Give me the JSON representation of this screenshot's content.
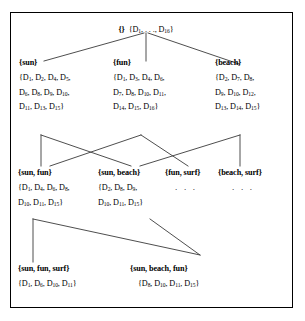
{
  "figure": {
    "type": "concept-lattice-diagram",
    "border_color": "#000000",
    "line_color": "#3a3a3a",
    "background": "#ffffff"
  },
  "nodes": {
    "root": {
      "id": "root",
      "label": "{}",
      "docs": [
        "{D1, . . ., D16}"
      ],
      "docs_plain": "{D1, . . ., D16}"
    },
    "sun": {
      "id": "sun",
      "label": "{sun}",
      "docs": [
        "{D1, D2, D4, D5,",
        "D6, D8, D9, D10,",
        "D11, D13, D15}"
      ]
    },
    "fun": {
      "id": "fun",
      "label": "{fun}",
      "docs": [
        "{D1, D3, D4, D6,",
        "D7, D8, D10, D11,",
        "D14, D15, D16}"
      ]
    },
    "beach": {
      "id": "beach",
      "label": "{beach}",
      "docs": [
        "{D2, D7, D8,",
        "D9, D10, D12,",
        "D13, D14, D15}"
      ]
    },
    "sun_fun": {
      "id": "sun-fun",
      "label": "{sun, fun}",
      "docs": [
        "{D1, D4, D6, D8,",
        "D10, D11, D15}"
      ]
    },
    "sun_beach": {
      "id": "sun-beach",
      "label": "{sun, beach}",
      "docs": [
        "{D2, D8, D9,",
        "D10, D11, D15}"
      ]
    },
    "fun_surf": {
      "id": "fun-surf",
      "label": "{fun, surf}",
      "docs": [
        ". . ."
      ]
    },
    "beach_surf": {
      "id": "beach-surf",
      "label": "{beach, surf}",
      "docs": [
        ". . ."
      ]
    },
    "sun_fun_surf": {
      "id": "sun-fun-surf",
      "label": "{sun, fun, surf}",
      "docs": [
        "{D1, D6, D10, D11}"
      ]
    },
    "sun_beach_fun": {
      "id": "sun-beach-fun",
      "label": "{sun, beach, fun}",
      "docs": [
        "{D8, D10, D11, D15}"
      ]
    }
  },
  "edges": [
    {
      "from": "root",
      "to": "sun"
    },
    {
      "from": "root",
      "to": "fun"
    },
    {
      "from": "root",
      "to": "beach"
    },
    {
      "from": "sun",
      "to": "sun-fun"
    },
    {
      "from": "sun",
      "to": "sun-beach"
    },
    {
      "from": "fun",
      "to": "sun-fun"
    },
    {
      "from": "fun",
      "to": "fun-surf"
    },
    {
      "from": "beach",
      "to": "sun-beach"
    },
    {
      "from": "beach",
      "to": "beach-surf"
    },
    {
      "from": "sun-fun",
      "to": "sun-fun-surf"
    },
    {
      "from": "sun-fun",
      "to": "sun-beach-fun"
    },
    {
      "from": "sun-beach",
      "to": "sun-beach-fun"
    }
  ]
}
